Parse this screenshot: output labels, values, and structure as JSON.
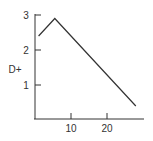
{
  "chart_data": {
    "type": "line",
    "title": "",
    "xlabel": "",
    "ylabel": "D+",
    "x": [
      1,
      5.5,
      28
    ],
    "series": [
      {
        "name": "D+",
        "values": [
          2.4,
          2.9,
          0.4
        ]
      }
    ],
    "xlim": [
      0,
      30
    ],
    "ylim": [
      0,
      3
    ],
    "xticks": [
      10,
      20
    ],
    "yticks": [
      1,
      2,
      3
    ],
    "grid": false,
    "legend": null
  },
  "colors": {
    "line": "#333333",
    "axis": "#333333"
  },
  "labels": {
    "ylabel": "D+",
    "xtick_10": "10",
    "xtick_20": "20",
    "ytick_1": "1",
    "ytick_2": "2",
    "ytick_3": "3"
  }
}
